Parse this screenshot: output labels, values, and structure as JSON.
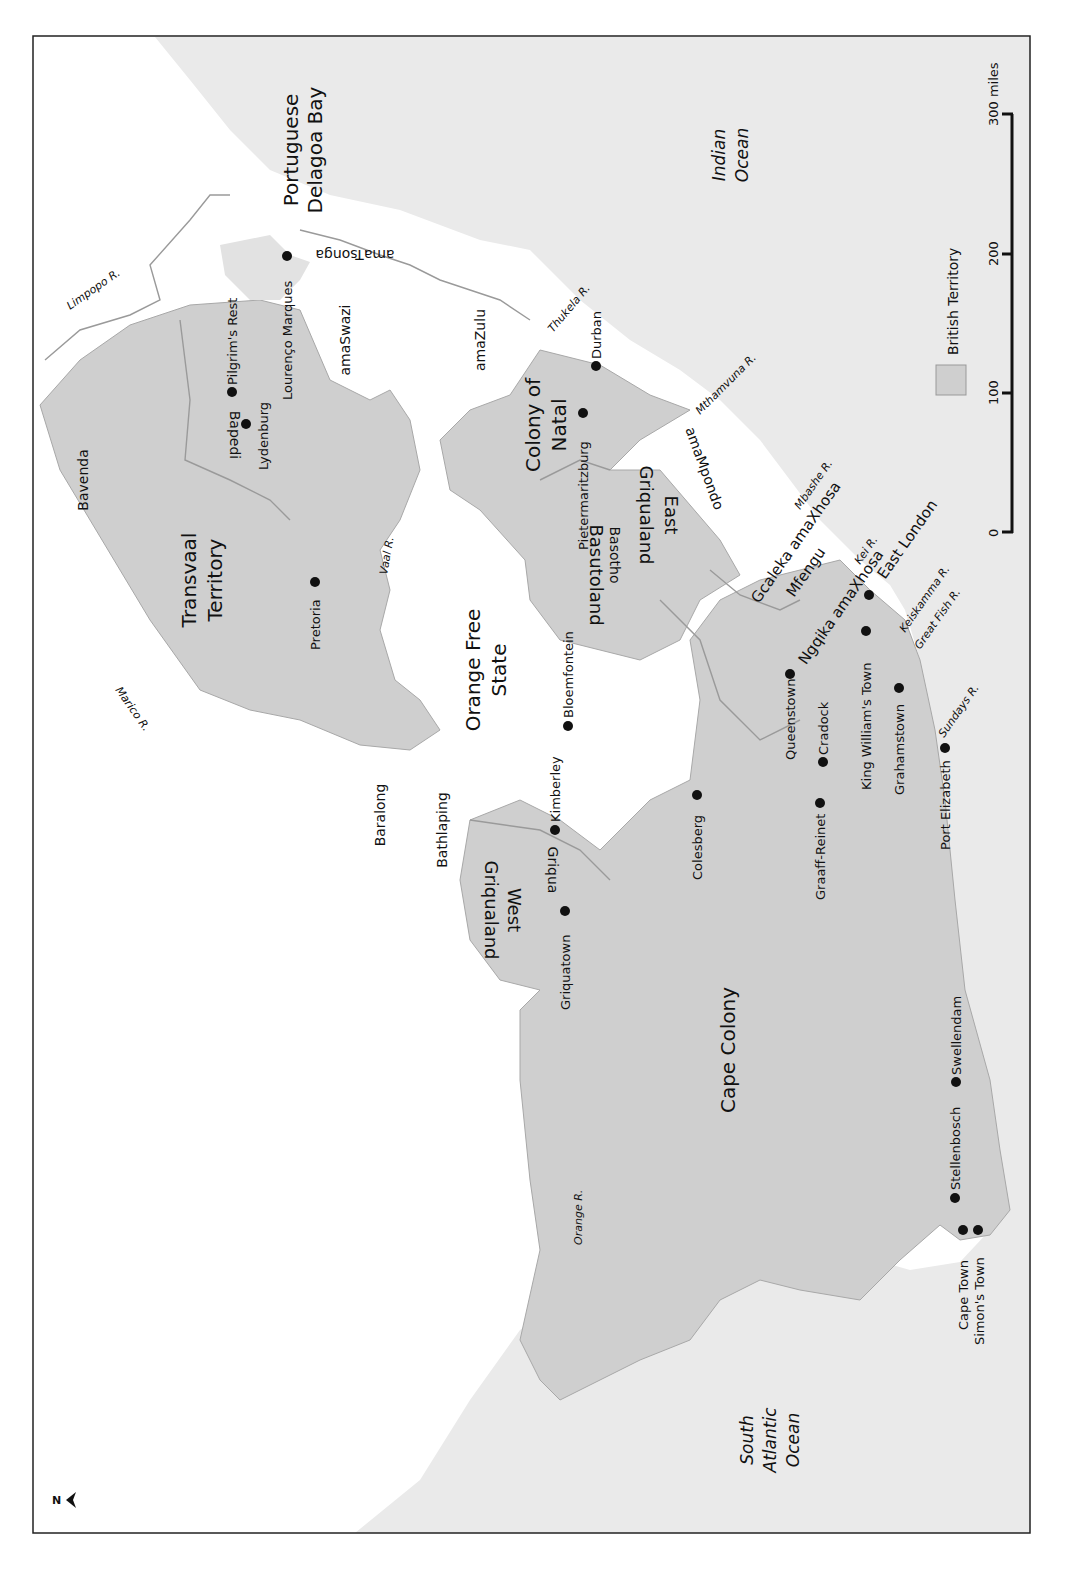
{
  "map": {
    "orientation": "rotated 90 degrees; north arrow points left",
    "colors": {
      "ocean": "#eaeaea",
      "british_territory": "#cfcfcf",
      "other_land": "#ffffff",
      "border": "#9a9a9a",
      "frame": "#222222"
    },
    "oceans": [
      {
        "id": "indian",
        "lines": [
          "Indian",
          "Ocean"
        ]
      },
      {
        "id": "atlantic",
        "lines": [
          "South",
          "Atlantic",
          "Ocean"
        ]
      }
    ],
    "regions": {
      "transvaal": [
        "Transvaal",
        "Territory"
      ],
      "ofs": [
        "Orange Free",
        "State"
      ],
      "natal": [
        "Colony of",
        "Natal"
      ],
      "cape": "Cape Colony",
      "basutoland": "Basutoland",
      "griqualand_east": [
        "Griqualand",
        "East"
      ],
      "griqualand_west": [
        "Griqualand",
        "West"
      ],
      "portuguese": [
        "Portuguese",
        "Delagoa Bay"
      ]
    },
    "peoples": {
      "bavenda": "Bavenda",
      "bapedi": "Bapedi",
      "amaswazi": "amaSwazi",
      "amazulu": "amaZulu",
      "amatsonga": "amaTsonga",
      "amampondo": "amaMpondo",
      "basotho": "Basotho",
      "gcaleka": "Gcaleka amaXhosa",
      "mfengu": "Mfengu",
      "ngqika": "Ngqika amaXhosa",
      "baralong": "Baralong",
      "bathlaping": "Bathlaping",
      "griqua": "Griqua"
    },
    "towns": {
      "pilgrims_rest": "Pilgrim's Rest",
      "lydenburg": "Lydenburg",
      "lourenco": "Lourenço Marques",
      "pretoria": "Pretoria",
      "durban": "Durban",
      "pietermaritzburg": "Pietermaritzburg",
      "bloemfontein": "Bloemfontein",
      "kimberley": "Kimberley",
      "griquatown": "Griquatown",
      "colesberg": "Colesberg",
      "queenstown": "Queenstown",
      "cradock": "Cradock",
      "graaff_reinet": "Graaff-Reinet",
      "king_williams": "King William's Town",
      "east_london": "East London",
      "grahamstown": "Grahamstown",
      "port_elizabeth": "Port Elizabeth",
      "swellendam": "Swellendam",
      "stellenbosch": "Stellenbosch",
      "cape_town": "Cape Town",
      "simons_town": "Simon's Town"
    },
    "rivers": {
      "limpopo": "Limpopo R.",
      "marico": "Marico R.",
      "vaal": "Vaal R.",
      "thukela": "Thukela R.",
      "mthamvuna": "Mthamvuna R.",
      "mbashe": "Mbashe R.",
      "kei": "Kei R.",
      "keiskamma": "Keiskamma R.",
      "great_fish": "Great Fish R.",
      "sundays": "Sundays R.",
      "orange": "Orange R."
    },
    "legend": {
      "british_territory": "British Territory"
    },
    "scale_bar": {
      "ticks": [
        "0",
        "100",
        "200",
        "300 miles"
      ]
    },
    "north_arrow": "N"
  }
}
